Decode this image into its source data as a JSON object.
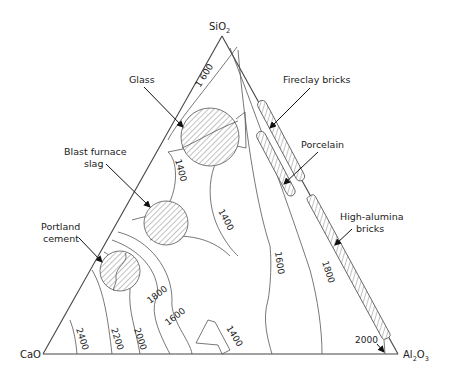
{
  "diagram": {
    "type": "ternary phase diagram",
    "vertices": {
      "top": {
        "label": "SiO",
        "subscript": "2"
      },
      "left": {
        "label": "CaO"
      },
      "right": {
        "label": "Al",
        "sub1": "2",
        "mid": "O",
        "sub2": "3"
      }
    },
    "regions": [
      {
        "id": "glass",
        "label": "Glass"
      },
      {
        "id": "blast-furnace-slag",
        "label_line1": "Blast furnace",
        "label_line2": "slag"
      },
      {
        "id": "portland-cement",
        "label_line1": "Portland",
        "label_line2": "cement"
      },
      {
        "id": "fireclay-bricks",
        "label": "Fireclay bricks"
      },
      {
        "id": "porcelain",
        "label": "Porcelain"
      },
      {
        "id": "high-alumina-bricks",
        "label_line1": "High-alumina",
        "label_line2": "bricks"
      }
    ],
    "isotherms": {
      "t1600_top": "1 600",
      "t1400_a": "1400",
      "t1400_b": "1400",
      "t1400_c": "1400",
      "t1600_mid": "1600",
      "t1600_left": "1600",
      "t1800_right": "1800",
      "t1800_left": "1800",
      "t2000_left": "2000",
      "t2200": "2200",
      "t2400": "2400",
      "t2000_right": "2000"
    }
  }
}
